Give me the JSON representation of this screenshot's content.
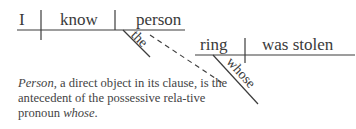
{
  "diagram": {
    "type": "Reed-Kellogg sentence diagram",
    "main_clause": {
      "subject": "I",
      "verb": "know",
      "direct_object": "person",
      "modifier_of_object": "the"
    },
    "relative_clause": {
      "subject": "ring",
      "verb": "was stolen",
      "modifier_of_subject": "whose"
    },
    "connector": "dashed line linking person to whose"
  },
  "caption": {
    "lead_word": "Person",
    "text_1": ", a direct object in its clause, is the antecedent of the possessive rela-tive pronoun ",
    "italic_end": "whose",
    "end": "."
  },
  "colors": {
    "line": "#3c3c3c",
    "text": "#3a3a3a",
    "background": "#ffffff"
  }
}
